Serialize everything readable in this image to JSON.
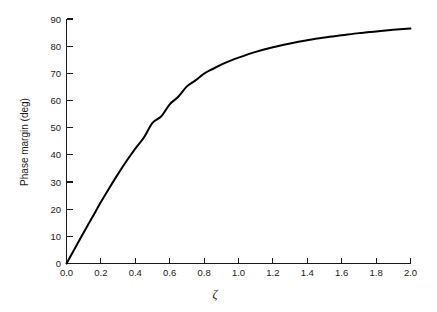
{
  "chart_data": {
    "type": "line",
    "title": "",
    "xlabel": "ζ",
    "ylabel": "Phase margin (deg)",
    "xlim": [
      0.0,
      2.0
    ],
    "ylim": [
      0,
      90
    ],
    "grid": false,
    "legend": "none",
    "xticks": [
      "0.0",
      "0.2",
      "0.4",
      "0.6",
      "0.8",
      "1.0",
      "1.2",
      "1.4",
      "1.6",
      "1.8",
      "2.0"
    ],
    "xtick_values": [
      0.0,
      0.2,
      0.4,
      0.6,
      0.8,
      1.0,
      1.2,
      1.4,
      1.6,
      1.8,
      2.0
    ],
    "yticks": [
      "0",
      "10",
      "20",
      "30",
      "40",
      "50",
      "60",
      "70",
      "80",
      "90"
    ],
    "ytick_values": [
      0,
      10,
      20,
      30,
      40,
      50,
      60,
      70,
      80,
      90
    ],
    "series": [
      {
        "name": "Phase margin vs damping ratio",
        "color": "#000000",
        "x": [
          0.0,
          0.05,
          0.1,
          0.15,
          0.2,
          0.25,
          0.3,
          0.35,
          0.4,
          0.45,
          0.5,
          0.55,
          0.6,
          0.65,
          0.7,
          0.75,
          0.8,
          0.85,
          0.9,
          0.95,
          1.0,
          1.1,
          1.2,
          1.3,
          1.4,
          1.5,
          1.6,
          1.7,
          1.8,
          1.9,
          2.0
        ],
        "values": [
          0.0,
          5.7,
          11.4,
          17.0,
          22.6,
          27.9,
          33.0,
          37.8,
          42.3,
          46.4,
          51.8,
          54.1,
          58.6,
          61.4,
          65.2,
          67.4,
          69.9,
          71.6,
          73.2,
          74.6,
          75.8,
          77.9,
          79.6,
          81.0,
          82.2,
          83.2,
          84.0,
          84.8,
          85.4,
          86.0,
          86.5
        ]
      }
    ],
    "annotations": []
  },
  "axes": {
    "x_axis_label": "ζ",
    "y_axis_label": "Phase margin (deg)"
  }
}
